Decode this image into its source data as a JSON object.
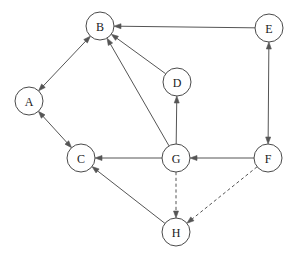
{
  "diagram": {
    "canvas": {
      "width": 300,
      "height": 261,
      "background": "#ffffff"
    },
    "style": {
      "node_stroke": "#4a4a4a",
      "node_fill": "#ffffff",
      "edge_stroke": "#555555",
      "label_color": "#1a1a1a",
      "node_radius": 14
    },
    "nodes": [
      {
        "id": "A",
        "label": "A",
        "x": 29,
        "y": 101
      },
      {
        "id": "B",
        "label": "B",
        "x": 100,
        "y": 26
      },
      {
        "id": "C",
        "label": "C",
        "x": 81,
        "y": 158
      },
      {
        "id": "D",
        "label": "D",
        "x": 177,
        "y": 82
      },
      {
        "id": "E",
        "label": "E",
        "x": 269,
        "y": 28
      },
      {
        "id": "F",
        "label": "F",
        "x": 268,
        "y": 158
      },
      {
        "id": "G",
        "label": "G",
        "x": 176,
        "y": 158
      },
      {
        "id": "H",
        "label": "H",
        "x": 176,
        "y": 232
      }
    ],
    "edges": [
      {
        "from": "A",
        "to": "B",
        "style": "solid",
        "arrows": "both"
      },
      {
        "from": "A",
        "to": "C",
        "style": "solid",
        "arrows": "both"
      },
      {
        "from": "E",
        "to": "B",
        "style": "solid",
        "arrows": "forward"
      },
      {
        "from": "D",
        "to": "B",
        "style": "solid",
        "arrows": "forward"
      },
      {
        "from": "G",
        "to": "B",
        "style": "solid",
        "arrows": "forward"
      },
      {
        "from": "G",
        "to": "D",
        "style": "solid",
        "arrows": "forward"
      },
      {
        "from": "G",
        "to": "C",
        "style": "solid",
        "arrows": "forward"
      },
      {
        "from": "F",
        "to": "G",
        "style": "solid",
        "arrows": "forward"
      },
      {
        "from": "E",
        "to": "F",
        "style": "solid",
        "arrows": "both"
      },
      {
        "from": "H",
        "to": "C",
        "style": "solid",
        "arrows": "forward"
      },
      {
        "from": "G",
        "to": "H",
        "style": "dashed",
        "arrows": "forward"
      },
      {
        "from": "F",
        "to": "H",
        "style": "dashed",
        "arrows": "forward"
      }
    ]
  }
}
